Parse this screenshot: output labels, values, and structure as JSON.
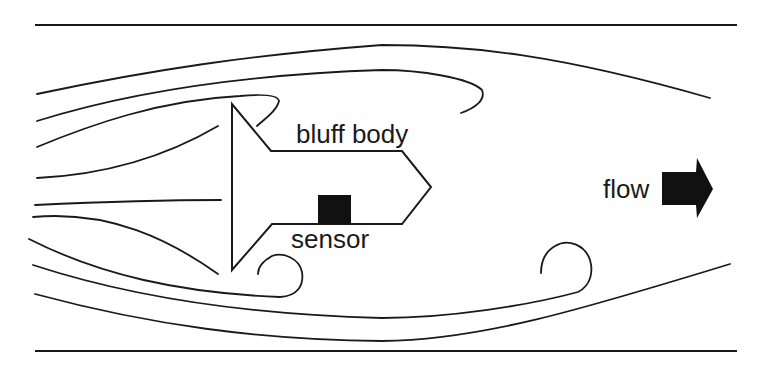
{
  "diagram": {
    "labels": {
      "bluff_body": "bluff body",
      "sensor": "sensor",
      "flow": "flow"
    },
    "elements": {
      "walls": [
        "top-wall",
        "bottom-wall"
      ],
      "bluff_body": "arrow-shaped body pointing downstream",
      "sensor": "black square on lower surface of body",
      "flow_arrow": "black block arrow pointing right",
      "streamlines": "curved flow lines with vortices shed behind body"
    },
    "colors": {
      "line": "#1a1a1a",
      "sensor_fill": "#111111",
      "arrow_fill": "#111111",
      "background": "#ffffff"
    }
  }
}
